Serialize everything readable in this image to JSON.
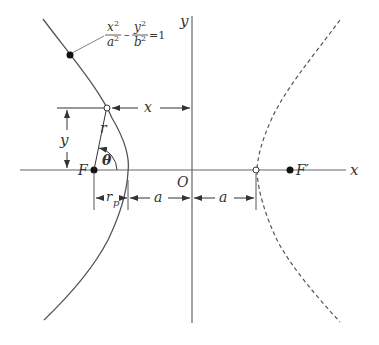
{
  "diagram": {
    "equation": {
      "x_num": "x",
      "x_den": "a",
      "y_num": "y",
      "y_den": "b",
      "exp": "2",
      "minus": "–",
      "rhs": "=1"
    },
    "labels": {
      "y_axis": "y",
      "x_axis": "x",
      "origin": "O",
      "focus_left": "F",
      "focus_right": "F′",
      "dist_x": "x",
      "dist_y": "y",
      "radius": "r",
      "angle": "θ",
      "rp_main": "r",
      "rp_sub": "p",
      "a_left": "a",
      "a_right": "a"
    },
    "colors": {
      "line": "#555555",
      "text": "#333333",
      "background": "#ffffff"
    }
  }
}
